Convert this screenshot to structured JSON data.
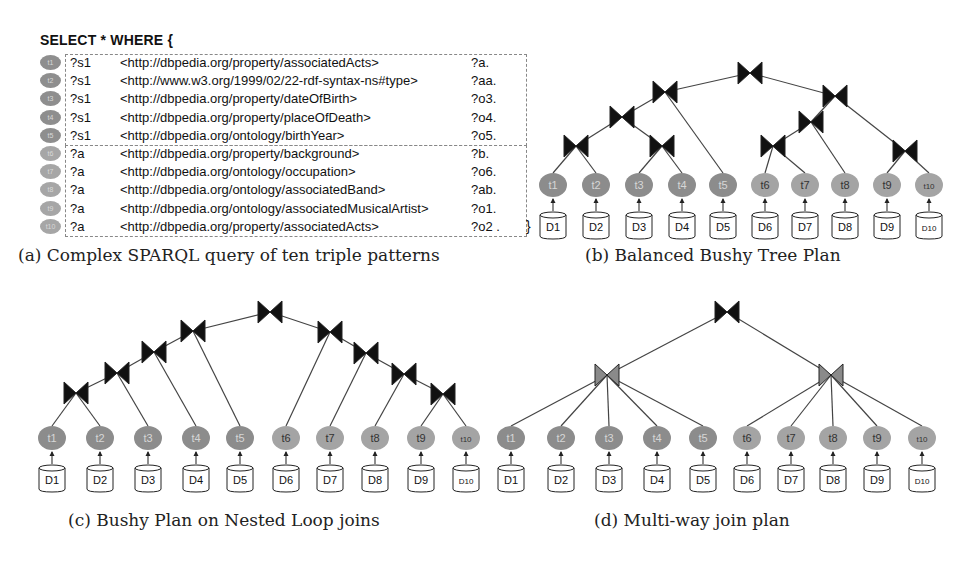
{
  "query": {
    "header": "SELECT * WHERE {",
    "closing": "}",
    "triples": [
      {
        "id": "t1",
        "subject": "?s1",
        "predicate": "<http://dbpedia.org/property/associatedActs>",
        "object": "?a."
      },
      {
        "id": "t2",
        "subject": "?s1",
        "predicate": "<http://www.w3.org/1999/02/22-rdf-syntax-ns#type>",
        "object": "?aa."
      },
      {
        "id": "t3",
        "subject": "?s1",
        "predicate": "<http://dbpedia.org/property/dateOfBirth>",
        "object": "?o3."
      },
      {
        "id": "t4",
        "subject": "?s1",
        "predicate": "<http://dbpedia.org/property/placeOfDeath>",
        "object": "?o4."
      },
      {
        "id": "t5",
        "subject": "?s1",
        "predicate": "<http://dbpedia.org/ontology/birthYear>",
        "object": "?o5."
      },
      {
        "id": "t6",
        "subject": "?a",
        "predicate": "<http://dbpedia.org/property/background>",
        "object": "?b."
      },
      {
        "id": "t7",
        "subject": "?a",
        "predicate": "<http://dbpedia.org/ontology/occupation>",
        "object": "?o6."
      },
      {
        "id": "t8",
        "subject": "?a",
        "predicate": "<http://dbpedia.org/ontology/associatedBand>",
        "object": "?ab."
      },
      {
        "id": "t9",
        "subject": "?a",
        "predicate": "<http://dbpedia.org/ontology/associatedMusicalArtist>",
        "object": "?o1."
      },
      {
        "id": "t10",
        "subject": "?a",
        "predicate": "<http://dbpedia.org/property/associatedActs>",
        "object": "?o2 ."
      }
    ]
  },
  "captions": {
    "a": "(a) Complex SPARQL query of ten triple patterns",
    "b": "(b) Balanced Bushy Tree Plan",
    "c": "(c) Bushy Plan on Nested Loop joins",
    "d": "(d) Multi-way join plan"
  },
  "leaves": {
    "triples": [
      "t1",
      "t2",
      "t3",
      "t4",
      "t5",
      "t6",
      "t7",
      "t8",
      "t9",
      "t10"
    ],
    "sources": [
      "D1",
      "D2",
      "D3",
      "D4",
      "D5",
      "D6",
      "D7",
      "D8",
      "D9",
      "D10"
    ]
  },
  "colors": {
    "dark_node": "#8c8c8c",
    "light_node": "#a4a4a4",
    "join_black": "#111111",
    "join_grey": "#8a8a8a",
    "edge": "#444444"
  }
}
